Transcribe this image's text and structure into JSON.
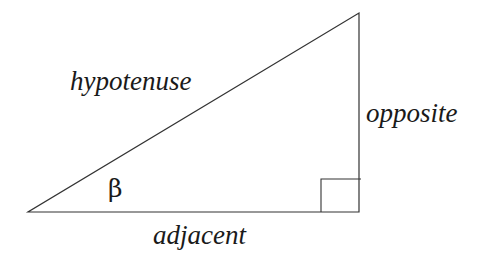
{
  "diagram": {
    "type": "right-triangle",
    "labels": {
      "hypotenuse": "hypotenuse",
      "opposite": "opposite",
      "adjacent": "adjacent",
      "angle": "β"
    },
    "line_color": "#333333"
  }
}
